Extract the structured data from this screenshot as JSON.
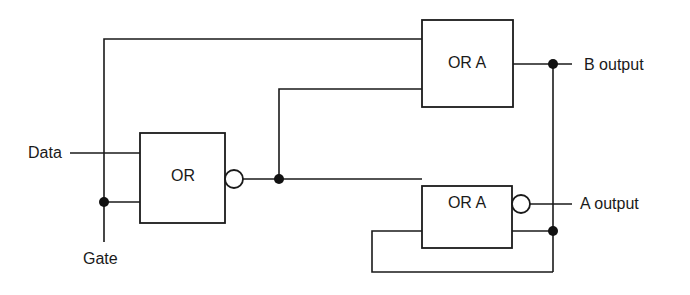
{
  "diagram": {
    "type": "logic-circuit",
    "inputs": [
      {
        "id": "data",
        "label": "Data"
      },
      {
        "id": "gate",
        "label": "Gate"
      }
    ],
    "gates": [
      {
        "id": "or1",
        "label": "OR",
        "inverted_output": true
      },
      {
        "id": "ora_top",
        "label": "OR A",
        "inverted_output": false
      },
      {
        "id": "ora_bottom",
        "label": "OR A",
        "inverted_output": true
      }
    ],
    "outputs": [
      {
        "id": "b_out",
        "label": "B output"
      },
      {
        "id": "a_out",
        "label": "A output"
      }
    ],
    "connections": [
      {
        "from": "data",
        "to": "or1"
      },
      {
        "from": "gate",
        "to": "or1"
      },
      {
        "from": "gate",
        "to": "ora_top"
      },
      {
        "from": "or1",
        "to": "ora_top"
      },
      {
        "from": "or1",
        "to": "ora_bottom"
      },
      {
        "from": "ora_top",
        "to": "b_out"
      },
      {
        "from": "ora_bottom",
        "to": "a_out"
      },
      {
        "from": "ora_top",
        "to": "ora_bottom",
        "note": "feedback loop"
      }
    ],
    "colors": {
      "line": "#1a1a1a",
      "background": "#ffffff"
    }
  }
}
